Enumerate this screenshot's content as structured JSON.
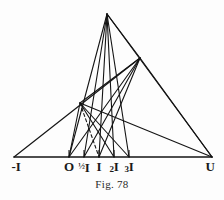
{
  "figure": {
    "caption": "Fig. 78",
    "background_color": "#fdfdfd",
    "ink_color": "#141414"
  },
  "axis": {
    "baseline_y": 157,
    "left_end_x": 14,
    "right_end_x": 212,
    "labels": [
      {
        "name": "label-minus-I",
        "text": "-I",
        "x": 16,
        "y": 160,
        "tick": false
      },
      {
        "name": "label-O",
        "text": "O",
        "x": 69,
        "y": 160,
        "tick": true
      },
      {
        "name": "label-half-I",
        "text": "½I",
        "x": 84,
        "y": 160,
        "tick": true
      },
      {
        "name": "label-I",
        "text": "I",
        "x": 99,
        "y": 160,
        "tick": true
      },
      {
        "name": "label-2I",
        "text": "2I",
        "x": 114,
        "y": 160,
        "tick": true
      },
      {
        "name": "label-3I",
        "text": "3I",
        "x": 129,
        "y": 160,
        "tick": true
      },
      {
        "name": "label-U",
        "text": "U",
        "x": 210,
        "y": 160,
        "tick": false
      }
    ]
  },
  "chart_data": {
    "type": "diagram",
    "title": "Fig. 78",
    "points": {
      "minusI": {
        "x": 14,
        "y": 157,
        "label": "-I"
      },
      "O": {
        "x": 69,
        "y": 157,
        "label": "O"
      },
      "halfI": {
        "x": 84,
        "y": 157,
        "label": "½I"
      },
      "I": {
        "x": 99,
        "y": 157,
        "label": "I"
      },
      "twoI": {
        "x": 114,
        "y": 157,
        "label": "2I"
      },
      "threeI": {
        "x": 129,
        "y": 157,
        "label": "3I"
      },
      "U": {
        "x": 212,
        "y": 157,
        "label": "U"
      },
      "apexA": {
        "x": 107,
        "y": 14,
        "label": ""
      },
      "apexB": {
        "x": 140,
        "y": 58,
        "label": ""
      },
      "nodeC": {
        "x": 80,
        "y": 103,
        "label": ""
      }
    },
    "segments": [
      {
        "name": "baseline",
        "from": "minusI",
        "to": "U",
        "style": "solid",
        "weight": 1.6
      },
      {
        "name": "apexA-to-O",
        "from": "apexA",
        "to": "O",
        "style": "solid",
        "weight": 1.1
      },
      {
        "name": "apexA-to-halfI",
        "from": "apexA",
        "to": "halfI",
        "style": "solid",
        "weight": 1.1
      },
      {
        "name": "apexA-to-I",
        "from": "apexA",
        "to": "I",
        "style": "solid",
        "weight": 1.1
      },
      {
        "name": "apexA-to-twoI",
        "from": "apexA",
        "to": "twoI",
        "style": "solid",
        "weight": 1.1
      },
      {
        "name": "apexA-to-threeI",
        "from": "apexA",
        "to": "threeI",
        "style": "solid",
        "weight": 1.1
      },
      {
        "name": "apexA-to-apexB",
        "from": "apexA",
        "to": "apexB",
        "style": "solid",
        "weight": 1.2
      },
      {
        "name": "apexA-to-U",
        "from": "apexA",
        "to": "U",
        "style": "solid",
        "weight": 1.2
      },
      {
        "name": "apexB-to-O",
        "from": "apexB",
        "to": "O",
        "style": "solid",
        "weight": 1.1
      },
      {
        "name": "apexB-to-halfI",
        "from": "apexB",
        "to": "halfI",
        "style": "solid",
        "weight": 1.1
      },
      {
        "name": "apexB-to-I",
        "from": "apexB",
        "to": "I",
        "style": "solid",
        "weight": 1.1
      },
      {
        "name": "apexB-to-nodeC",
        "from": "apexB",
        "to": "nodeC",
        "style": "solid",
        "weight": 1.1
      },
      {
        "name": "apexB-to-U",
        "from": "apexB",
        "to": "U",
        "style": "solid",
        "weight": 1.2
      },
      {
        "name": "minusI-to-apexB",
        "from": "minusI",
        "to": "apexB",
        "style": "solid",
        "weight": 1.2
      },
      {
        "name": "nodeC-to-U",
        "from": "nodeC",
        "to": "U",
        "style": "solid",
        "weight": 1.1
      },
      {
        "name": "nodeC-to-twoI",
        "from": "nodeC",
        "to": "twoI",
        "style": "solid",
        "weight": 1.1
      },
      {
        "name": "nodeC-to-threeI",
        "from": "nodeC",
        "to": "threeI",
        "style": "solid",
        "weight": 1.1
      },
      {
        "name": "nodeC-to-I-dashed",
        "from": "nodeC",
        "to": "I",
        "style": "dashed",
        "weight": 1.1
      },
      {
        "name": "O-to-nodeC",
        "from": "O",
        "to": "nodeC",
        "style": "solid",
        "weight": 1.1
      }
    ],
    "ticks": [
      {
        "name": "tick-O",
        "x": 69,
        "height": 7
      },
      {
        "name": "tick-halfI",
        "x": 84,
        "height": 7
      },
      {
        "name": "tick-I",
        "x": 99,
        "height": 7
      },
      {
        "name": "tick-twoI",
        "x": 114,
        "height": 7
      },
      {
        "name": "tick-threeI",
        "x": 129,
        "height": 7
      }
    ]
  }
}
